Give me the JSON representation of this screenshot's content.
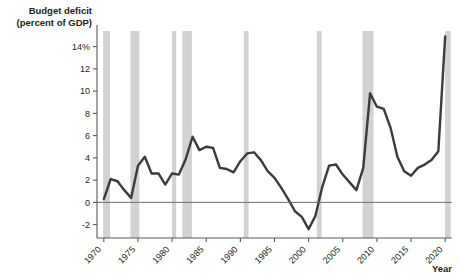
{
  "chart_data": {
    "type": "line",
    "title": "",
    "xlabel": "Year",
    "ylabel": "Budget deficit (percent of GDP)",
    "ylabel_line1": "Budget deficit",
    "ylabel_line2": "(percent of GDP)",
    "xlim": [
      1969,
      2021
    ],
    "ylim": [
      -3.2,
      15.4
    ],
    "grid": false,
    "legend": false,
    "zero_line": 0,
    "yticks": [
      -2,
      0,
      2,
      4,
      6,
      8,
      10,
      12,
      14
    ],
    "ytick_labels": [
      "-2",
      "0",
      "2",
      "4",
      "6",
      "8",
      "10",
      "12",
      "14%"
    ],
    "xticks": [
      1970,
      1975,
      1980,
      1985,
      1990,
      1995,
      2000,
      2005,
      2010,
      2015,
      2020
    ],
    "xtick_labels": [
      "1970",
      "1975",
      "1980",
      "1985",
      "1990",
      "1995",
      "2000",
      "2005",
      "2010",
      "2015",
      "2020"
    ],
    "series": [
      {
        "name": "Budget deficit (percent of GDP)",
        "color": "#3b3b3b",
        "x": [
          1970,
          1971,
          1972,
          1973,
          1974,
          1975,
          1976,
          1977,
          1978,
          1979,
          1980,
          1981,
          1982,
          1983,
          1984,
          1985,
          1986,
          1987,
          1988,
          1989,
          1990,
          1991,
          1992,
          1993,
          1994,
          1995,
          1996,
          1997,
          1998,
          1999,
          2000,
          2001,
          2002,
          2003,
          2004,
          2005,
          2006,
          2007,
          2008,
          2009,
          2010,
          2011,
          2012,
          2013,
          2014,
          2015,
          2016,
          2017,
          2018,
          2019,
          2020
        ],
        "values": [
          0.3,
          2.1,
          1.9,
          1.1,
          0.4,
          3.3,
          4.1,
          2.6,
          2.6,
          1.6,
          2.6,
          2.5,
          3.9,
          5.9,
          4.7,
          5.0,
          4.9,
          3.1,
          3.0,
          2.7,
          3.7,
          4.4,
          4.5,
          3.8,
          2.8,
          2.2,
          1.3,
          0.3,
          -0.8,
          -1.3,
          -2.4,
          -1.2,
          1.4,
          3.3,
          3.4,
          2.5,
          1.8,
          1.1,
          3.1,
          9.8,
          8.6,
          8.4,
          6.7,
          4.1,
          2.8,
          2.4,
          3.1,
          3.4,
          3.8,
          4.6,
          14.9
        ],
        "line_width": 2.4
      }
    ],
    "recession_bands": [
      {
        "start": 1969.9,
        "end": 1970.9
      },
      {
        "start": 1973.9,
        "end": 1975.2
      },
      {
        "start": 1980.0,
        "end": 1980.6
      },
      {
        "start": 1981.5,
        "end": 1982.9
      },
      {
        "start": 1990.5,
        "end": 1991.2
      },
      {
        "start": 2001.2,
        "end": 2001.9
      },
      {
        "start": 2007.9,
        "end": 2009.5
      },
      {
        "start": 2020.0,
        "end": 2020.8
      }
    ],
    "recession_band_color": "#d2d2d2"
  },
  "axes": {
    "axis_color": "#58595b",
    "tick_color": "#58595b",
    "zero_line_color": "#6d6e71",
    "background": "#ffffff"
  }
}
